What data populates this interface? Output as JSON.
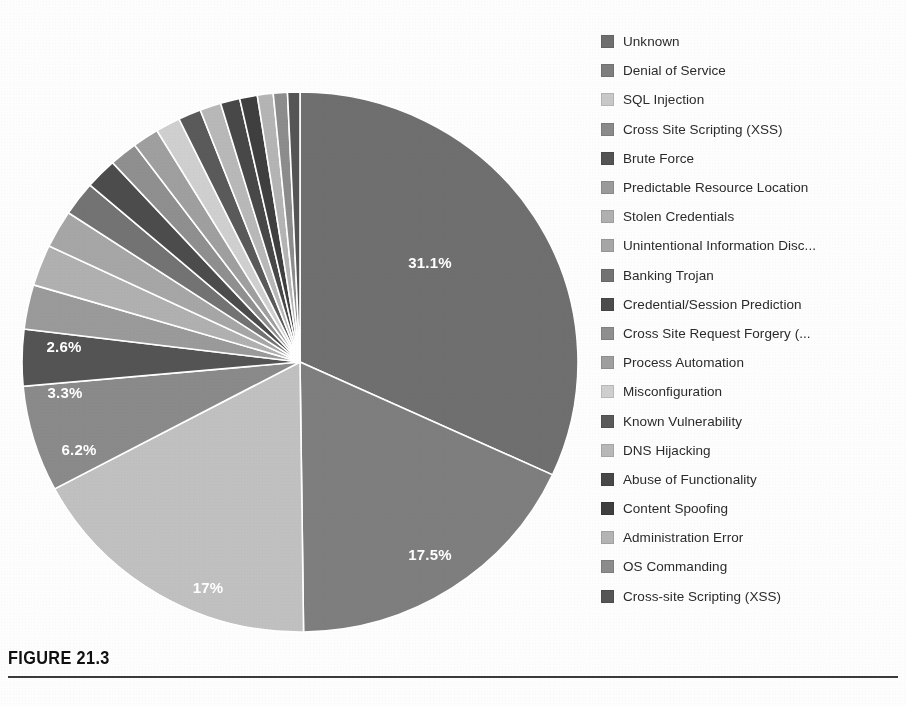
{
  "figure": {
    "caption": "FIGURE 21.3",
    "rule_color": "#3b3b3b"
  },
  "chart_data": {
    "type": "pie",
    "title": "",
    "legend_position": "right",
    "start_angle_deg": 0,
    "direction": "clockwise",
    "labels_shown": [
      "31.1%",
      "17.5%",
      "17%",
      "6.2%",
      "3.3%",
      "2.6%"
    ],
    "categories": [
      "Unknown",
      "Denial of Service",
      "SQL Injection",
      "Cross Site Scripting (XSS)",
      "Brute Force",
      "Predictable Resource Location",
      "Stolen Credentials",
      "Unintentional Information Disc...",
      "Banking Trojan",
      "Credential/Session Prediction",
      "Cross Site Request Forgery (...",
      "Process Automation",
      "Misconfiguration",
      "Known Vulnerability",
      "DNS Hijacking",
      "Abuse of Functionality",
      "Content Spoofing",
      "Administration Error",
      "OS Commanding",
      "Cross-site Scripting (XSS)"
    ],
    "values": [
      31.1,
      17.5,
      17.0,
      6.2,
      3.3,
      2.6,
      2.4,
      2.2,
      2.0,
      1.8,
      1.6,
      1.5,
      1.4,
      1.3,
      1.2,
      1.1,
      1.0,
      0.9,
      0.8,
      0.7
    ],
    "value_unit": "%",
    "colors": [
      "#6f6f6f",
      "#7e7e7e",
      "#c0c0c0",
      "#8a8a8a",
      "#545454",
      "#9a9a9a",
      "#b0b0b0",
      "#a6a6a6",
      "#737373",
      "#4c4c4c",
      "#8f8f8f",
      "#9f9f9f",
      "#cfcfcf",
      "#5a5a5a",
      "#b8b8b8",
      "#484848",
      "#3f3f3f",
      "#b4b4b4",
      "#8c8c8c",
      "#555555"
    ],
    "slice_labels": [
      {
        "text": "31.1%",
        "x": 430,
        "y": 268
      },
      {
        "text": "17.5%",
        "x": 430,
        "y": 560
      },
      {
        "text": "17%",
        "x": 208,
        "y": 593
      },
      {
        "text": "6.2%",
        "x": 79,
        "y": 455
      },
      {
        "text": "3.3%",
        "x": 65,
        "y": 398
      },
      {
        "text": "2.6%",
        "x": 64,
        "y": 352
      }
    ]
  },
  "legend": {
    "items": [
      {
        "label": "Unknown",
        "color": "#6f6f6f"
      },
      {
        "label": "Denial of Service",
        "color": "#7e7e7e"
      },
      {
        "label": "SQL Injection",
        "color": "#c8c8c8"
      },
      {
        "label": "Cross Site Scripting (XSS)",
        "color": "#8a8a8a"
      },
      {
        "label": "Brute Force",
        "color": "#545454"
      },
      {
        "label": "Predictable Resource Location",
        "color": "#9a9a9a"
      },
      {
        "label": "Stolen Credentials",
        "color": "#b0b0b0"
      },
      {
        "label": "Unintentional Information Disc...",
        "color": "#a6a6a6"
      },
      {
        "label": "Banking Trojan",
        "color": "#737373"
      },
      {
        "label": "Credential/Session Prediction",
        "color": "#4c4c4c"
      },
      {
        "label": "Cross Site Request Forgery (...",
        "color": "#8f8f8f"
      },
      {
        "label": "Process Automation",
        "color": "#9f9f9f"
      },
      {
        "label": "Misconfiguration",
        "color": "#cfcfcf"
      },
      {
        "label": "Known Vulnerability",
        "color": "#5a5a5a"
      },
      {
        "label": "DNS Hijacking",
        "color": "#b8b8b8"
      },
      {
        "label": "Abuse of Functionality",
        "color": "#484848"
      },
      {
        "label": "Content Spoofing",
        "color": "#3f3f3f"
      },
      {
        "label": "Administration Error",
        "color": "#b4b4b4"
      },
      {
        "label": "OS Commanding",
        "color": "#8c8c8c"
      },
      {
        "label": "Cross-site Scripting (XSS)",
        "color": "#555555"
      }
    ]
  },
  "geometry": {
    "cx": 300,
    "cy": 362,
    "rx": 278,
    "ry": 270
  }
}
